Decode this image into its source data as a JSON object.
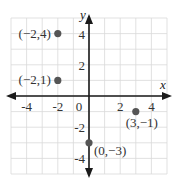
{
  "chart_data": {
    "type": "scatter",
    "title": "",
    "xlabel": "x",
    "ylabel": "y",
    "xlim": [
      -5,
      5
    ],
    "ylim": [
      -5,
      5
    ],
    "grid": true,
    "x_ticks": [
      "-4",
      "-2",
      "0",
      "2",
      "4"
    ],
    "y_ticks": [
      "4",
      "2",
      "-2",
      "-4"
    ],
    "points": [
      {
        "x": -2,
        "y": 4,
        "label": "(−2,4)"
      },
      {
        "x": -2,
        "y": 1,
        "label": "(−2,1)"
      },
      {
        "x": 0,
        "y": -3,
        "label": "(0,−3)"
      },
      {
        "x": 3,
        "y": -1,
        "label": "(3,−1)"
      }
    ],
    "colors": {
      "point": "#555555",
      "axis": "#1a1a1a",
      "grid": "#d9d9d9"
    }
  }
}
